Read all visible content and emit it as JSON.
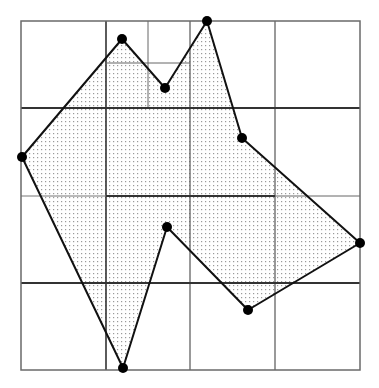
{
  "diagram": {
    "type": "quadtree-polygon-decomposition",
    "frame": {
      "x1": 21,
      "y1": 21,
      "x2": 360,
      "y2": 370,
      "color": "#6a6a6a"
    },
    "grid_lines": [
      {
        "id": "v-106",
        "x1": 106,
        "y1": 21,
        "x2": 106,
        "y2": 370,
        "w": 1.6,
        "color": "#333333"
      },
      {
        "id": "v-190",
        "x1": 190,
        "y1": 21,
        "x2": 190,
        "y2": 370,
        "w": 1.2,
        "color": "#555555"
      },
      {
        "id": "v-275",
        "x1": 275,
        "y1": 21,
        "x2": 275,
        "y2": 370,
        "w": 1.2,
        "color": "#555555"
      },
      {
        "id": "v-148-top",
        "x1": 148,
        "y1": 21,
        "x2": 148,
        "y2": 108,
        "w": 1.0,
        "color": "#666666"
      },
      {
        "id": "h-108",
        "x1": 21,
        "y1": 108,
        "x2": 360,
        "y2": 108,
        "w": 1.8,
        "color": "#333333"
      },
      {
        "id": "h-63-sub",
        "x1": 106,
        "y1": 63,
        "x2": 190,
        "y2": 63,
        "w": 1.0,
        "color": "#666666"
      },
      {
        "id": "h-196-left",
        "x1": 21,
        "y1": 196,
        "x2": 106,
        "y2": 196,
        "w": 1.0,
        "color": "#777777"
      },
      {
        "id": "h-196-mid",
        "x1": 106,
        "y1": 196,
        "x2": 275,
        "y2": 196,
        "w": 1.8,
        "color": "#333333"
      },
      {
        "id": "h-196-right",
        "x1": 275,
        "y1": 196,
        "x2": 360,
        "y2": 196,
        "w": 1.0,
        "color": "#666666"
      },
      {
        "id": "h-283",
        "x1": 21,
        "y1": 283,
        "x2": 360,
        "y2": 283,
        "w": 1.8,
        "color": "#333333"
      }
    ],
    "polygon": {
      "fill_pattern": "stipple-dots",
      "dot_color": "#9a9a9a",
      "stroke_color": "#111111",
      "stroke_width": 2,
      "vertices": [
        {
          "x": 122,
          "y": 39
        },
        {
          "x": 165,
          "y": 88
        },
        {
          "x": 207,
          "y": 21
        },
        {
          "x": 242,
          "y": 138
        },
        {
          "x": 360,
          "y": 243
        },
        {
          "x": 248,
          "y": 310
        },
        {
          "x": 167,
          "y": 227
        },
        {
          "x": 123,
          "y": 368
        },
        {
          "x": 22,
          "y": 157
        }
      ]
    },
    "vertex_marker": {
      "radius": 5,
      "color": "#000000"
    }
  }
}
